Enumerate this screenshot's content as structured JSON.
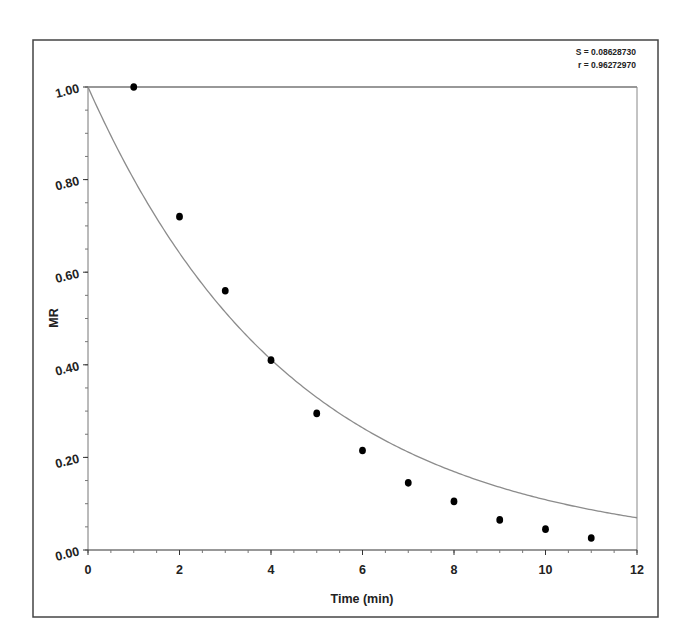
{
  "chart_data": {
    "type": "scatter",
    "title": "",
    "xlabel": "Time (min)",
    "ylabel": "MR",
    "xlim": [
      0,
      12
    ],
    "ylim": [
      0.0,
      1.0
    ],
    "x_ticks": [
      0,
      2,
      4,
      6,
      8,
      10,
      12
    ],
    "x_tick_labels": [
      "0",
      "2",
      "4",
      "6",
      "8",
      "10",
      "12"
    ],
    "x_minor_step": 0.5,
    "y_ticks": [
      0.0,
      0.2,
      0.4,
      0.6,
      0.8,
      1.0
    ],
    "y_tick_labels": [
      "0.00",
      "0.20",
      "0.40",
      "0.60",
      "0.80",
      "1.00"
    ],
    "y_minor_step": 0.05,
    "grid": false,
    "legend": null,
    "annotations": [
      {
        "text": "S = 0.08628730",
        "position": "top-right"
      },
      {
        "text": "r = 0.96272970",
        "position": "top-right"
      }
    ],
    "series": [
      {
        "name": "Experimental MR",
        "kind": "scatter",
        "marker": "filled-circle",
        "color": "#000000",
        "x": [
          1,
          2,
          3,
          4,
          5,
          6,
          7,
          8,
          9,
          10,
          11
        ],
        "y": [
          1.0,
          0.72,
          0.56,
          0.41,
          0.295,
          0.215,
          0.145,
          0.105,
          0.065,
          0.045,
          0.026
        ]
      },
      {
        "name": "Model fit",
        "kind": "line",
        "color": "#8c8c8c",
        "model": "MR = exp(-k*t)",
        "k": 0.222,
        "x": [
          0,
          1,
          2,
          3,
          4,
          5,
          6,
          7,
          8,
          9,
          10,
          11,
          12
        ],
        "y": [
          1.0,
          0.8,
          0.64,
          0.51,
          0.41,
          0.33,
          0.26,
          0.21,
          0.17,
          0.136,
          0.109,
          0.087,
          0.07
        ]
      }
    ]
  },
  "stats": {
    "s_label": "S = 0.08628730",
    "r_label": "r = 0.96272970"
  },
  "colors": {
    "axis": "#333333",
    "frame": "#444444",
    "curve": "#8c8c8c",
    "marker": "#000000",
    "text": "#222222"
  }
}
